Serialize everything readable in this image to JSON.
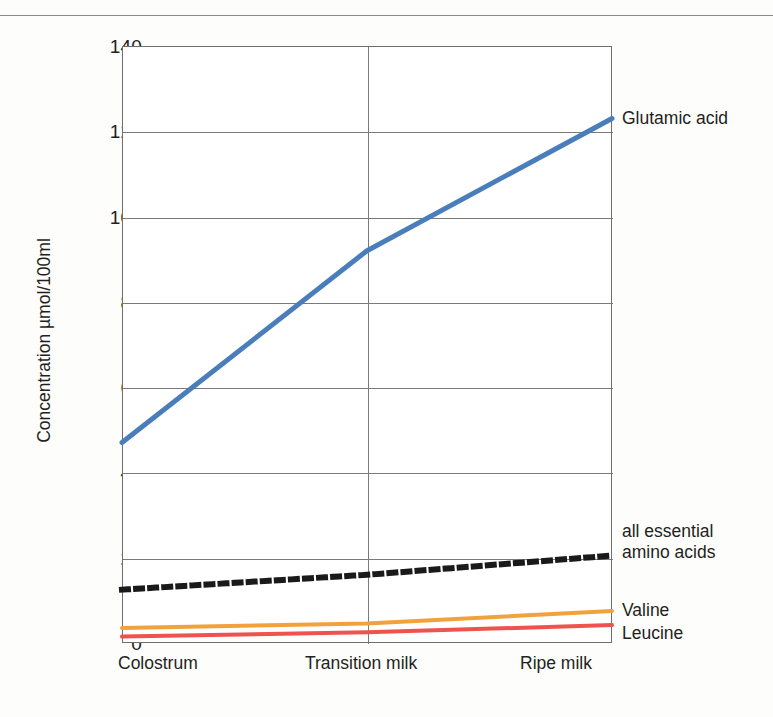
{
  "chart_data": {
    "type": "line",
    "title": "",
    "xlabel": "",
    "ylabel": "Concentration µmol/100ml",
    "categories": [
      "Colostrum",
      "Transition milk",
      "Ripe milk"
    ],
    "ylim": [
      0,
      140
    ],
    "yticks": [
      0,
      20,
      40,
      60,
      80,
      100,
      120,
      140
    ],
    "ytick_labels": [
      "0",
      "20",
      "40",
      "60",
      "80",
      "100",
      "120",
      "140"
    ],
    "grid": "horizontal-and-vertical",
    "legend_position": "right-of-plot-line-ends",
    "series": [
      {
        "name": "Glutamic acid",
        "label": "Glutamic acid",
        "color": "#4a7ebb",
        "style": "solid",
        "width": 5,
        "values": [
          47,
          92,
          123
        ]
      },
      {
        "name": "all essential amino acids",
        "label": "all essential\namino acids",
        "color": "#1a1a1a",
        "style": "dotted",
        "width": 6,
        "values": [
          12.5,
          16,
          20.5
        ]
      },
      {
        "name": "Valine",
        "label": "Valine",
        "color": "#f2a23c",
        "style": "solid",
        "width": 4,
        "values": [
          3.5,
          4.6,
          7.5
        ]
      },
      {
        "name": "Leucine",
        "label": "Leucine",
        "color": "#ef5350",
        "style": "solid",
        "width": 4,
        "values": [
          1.5,
          2.5,
          4.2
        ]
      }
    ]
  },
  "axis": {
    "y_title": "Concentration µmol/100ml",
    "y_labels": [
      "140",
      "120",
      "100",
      "80",
      "60",
      "40",
      "20",
      "0"
    ],
    "x_labels": [
      "Colostrum",
      "Transition milk",
      "Ripe milk"
    ]
  },
  "labels": {
    "glutamic_acid": "Glutamic acid",
    "essential_line1": "all essential",
    "essential_line2": "amino acids",
    "valine": "Valine",
    "leucine": "Leucine"
  },
  "colors": {
    "glutamic_acid": "#4a7ebb",
    "essential": "#1a1a1a",
    "valine": "#f2a23c",
    "leucine": "#ef5350",
    "grid": "#7a7a7a",
    "background": "#fdfdfb"
  }
}
